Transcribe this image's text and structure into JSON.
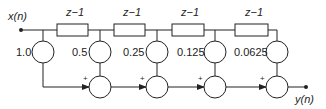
{
  "diagram": {
    "type": "FIR filter block diagram (direct form)",
    "input_label": "x(n)",
    "output_label": "y(n)",
    "delay_label": "z−1",
    "delays": [
      {
        "label": "z−1"
      },
      {
        "label": "z−1"
      },
      {
        "label": "z−1"
      },
      {
        "label": "z−1"
      }
    ],
    "coefficients": [
      {
        "label": "1.0"
      },
      {
        "label": "0.5"
      },
      {
        "label": "0.25"
      },
      {
        "label": "0.125"
      },
      {
        "label": "0.0625"
      }
    ],
    "adders": [
      {
        "sign": "+"
      },
      {
        "sign": "+"
      },
      {
        "sign": "+"
      },
      {
        "sign": "+"
      }
    ]
  }
}
